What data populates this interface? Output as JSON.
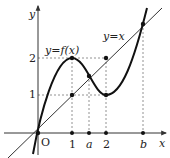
{
  "diagram": {
    "type": "function-graph",
    "axes": {
      "x_label": "x",
      "y_label": "y",
      "origin_label": "O"
    },
    "x_ticks": [
      {
        "label": "1",
        "value": 1
      },
      {
        "label": "a",
        "value": 1.5
      },
      {
        "label": "2",
        "value": 2
      },
      {
        "label": "b",
        "value": 3.1
      }
    ],
    "y_ticks": [
      {
        "label": "1",
        "value": 1
      },
      {
        "label": "2",
        "value": 2
      }
    ],
    "curves": [
      {
        "name": "f",
        "label": "y=f(x)",
        "description": "cubic-like curve through origin, local max at (1,2), local min at (2,1)"
      },
      {
        "name": "identity",
        "label": "y=x",
        "description": "straight line through origin"
      }
    ],
    "points": [
      {
        "name": "origin",
        "x": 0,
        "y": 0
      },
      {
        "name": "max",
        "x": 1,
        "y": 2
      },
      {
        "name": "line-at-1",
        "x": 1,
        "y": 1
      },
      {
        "name": "intersection-a",
        "x": 1.5,
        "y": 1.5
      },
      {
        "name": "line-at-2",
        "x": 2,
        "y": 2
      },
      {
        "name": "min",
        "x": 2,
        "y": 1
      },
      {
        "name": "intersection-b",
        "x": 3.1,
        "y": 3.1
      }
    ],
    "colors": {
      "curve": "#111111",
      "line": "#333333",
      "dashed": "#777777",
      "axis": "#333333"
    }
  }
}
